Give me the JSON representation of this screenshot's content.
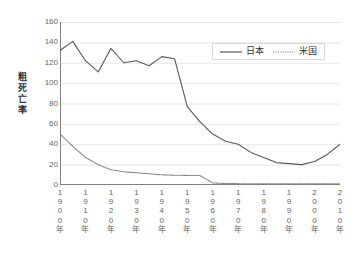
{
  "chart_data": {
    "type": "line",
    "title": "",
    "xlabel": "",
    "ylabel": "粗死亡率",
    "ylim": [
      0,
      160
    ],
    "yticks": [
      0,
      20,
      40,
      60,
      80,
      100,
      120,
      140,
      160
    ],
    "ytick_labels": [
      "0",
      "20",
      "40",
      "60",
      "80",
      "100",
      "120",
      "140",
      "160"
    ],
    "categories": [
      "1900年",
      "1910年",
      "1920年",
      "1930年",
      "1940年",
      "1950年",
      "1960年",
      "1970年",
      "1980年",
      "1990年",
      "2000年",
      "2010年"
    ],
    "x": [
      1900,
      1910,
      1920,
      1930,
      1940,
      1950,
      1960,
      1970,
      1980,
      1990,
      2000,
      2010
    ],
    "grid": true,
    "legend_position": "top-right",
    "series": [
      {
        "name": "日本",
        "style": "solid",
        "color": "#595959",
        "x": [
          1900,
          1905,
          1910,
          1915,
          1920,
          1925,
          1930,
          1935,
          1940,
          1945,
          1950,
          1955,
          1960,
          1965,
          1970,
          1975,
          1980,
          1985,
          1990,
          1995,
          2000,
          2005,
          2010
        ],
        "values": [
          132,
          141,
          122,
          111,
          134,
          120,
          122,
          117,
          126,
          124,
          77,
          62,
          50,
          43,
          40,
          32,
          27,
          22,
          21,
          20,
          23,
          30,
          40
        ]
      },
      {
        "name": "米国",
        "style": "dotted",
        "color": "#7f7f7f",
        "x": [
          1900,
          1905,
          1910,
          1915,
          1920,
          1925,
          1930,
          1935,
          1940,
          1945,
          1950,
          1955,
          1960,
          1965,
          1970,
          1975,
          1980,
          1985,
          1990,
          1995,
          2000,
          2005,
          2010
        ],
        "values": [
          50,
          38,
          27,
          20,
          15,
          13,
          12,
          11,
          10,
          9.6,
          9.4,
          9.3,
          2,
          1.5,
          1.3,
          1.2,
          1.2,
          1.2,
          1.2,
          1.2,
          1.2,
          1.2,
          1.2
        ]
      }
    ]
  },
  "legend": {
    "entries": [
      {
        "label": "日本"
      },
      {
        "label": "米国"
      }
    ]
  }
}
